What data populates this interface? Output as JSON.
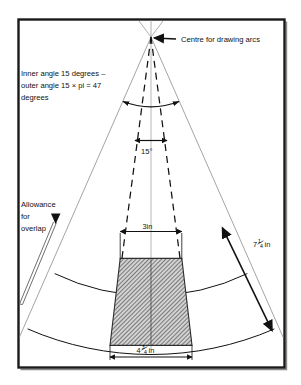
{
  "figure": {
    "frame": {
      "border_color": "#1a1a1a",
      "background": "#ffffff"
    },
    "annotations": {
      "centre": {
        "text": "Centre for drawing arcs",
        "icon": "arrow-left-icon"
      },
      "angle_note": {
        "line1": "Inner angle 15 degrees –",
        "line2": "outer angle 15 × pi = 47",
        "line3": "degrees"
      },
      "allowance": {
        "line1": "Allowance",
        "line2": "for",
        "line3": "overlap",
        "icon": "arrow-down-icon"
      },
      "inner_angle": {
        "text": "15°"
      }
    },
    "dimensions": {
      "top_width": {
        "value": "3",
        "unit": "in",
        "text": "3in"
      },
      "bottom_width": {
        "whole": "4",
        "numerator": "3",
        "denominator": "4",
        "unit": "in",
        "text": "4¾ in"
      },
      "slant_height": {
        "whole": "7",
        "numerator": "1",
        "denominator": "4",
        "unit": "in",
        "text": "7¼ in"
      }
    },
    "colors": {
      "frame": "#1a1a1a",
      "construction_line": "#8d8d8d",
      "dashed_line": "#111111",
      "arc_line": "#111111",
      "hatch": "#3b3b3b",
      "hatch_fill": "#c9c9c9",
      "text": "#111111"
    },
    "geometry": {
      "apex_x": 151,
      "apex_y": 37,
      "inner_arc_radius": 221,
      "outer_arc_radius": 310,
      "sector_half_angle_deg": 23.5,
      "inner_wedge_half_angle_deg": 7.5
    }
  }
}
